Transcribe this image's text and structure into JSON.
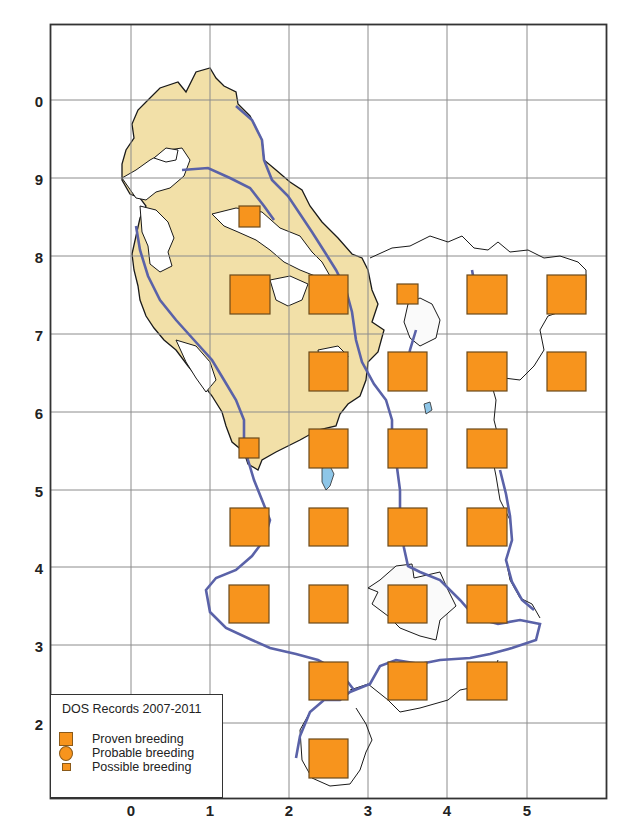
{
  "map": {
    "title": "DOS Records 2007-2011",
    "colors": {
      "record_fill": "#f7941d",
      "record_stroke": "#6b4a1c",
      "land_shading": "#f2e0a8",
      "river": "#5a62a8",
      "water": "#8ec6e8",
      "grid": "#888888",
      "frame": "#333333"
    },
    "x_axis_labels": [
      "0",
      "1",
      "2",
      "3",
      "4",
      "5"
    ],
    "y_axis_labels": [
      "0",
      "9",
      "8",
      "7",
      "6",
      "5",
      "4",
      "3",
      "2"
    ],
    "legend": {
      "title": "DOS Records 2007-2011",
      "items": [
        {
          "label": "Proven breeding",
          "symbol": "large-square"
        },
        {
          "label": "Probable breeding",
          "symbol": "circle"
        },
        {
          "label": "Possible breeding",
          "symbol": "small-square"
        }
      ]
    },
    "records": [
      {
        "grid_x": 1,
        "grid_y": "9",
        "status": "possible"
      },
      {
        "grid_x": 1,
        "grid_y": "8",
        "status": "proven"
      },
      {
        "grid_x": 2,
        "grid_y": "8",
        "status": "proven"
      },
      {
        "grid_x": 3,
        "grid_y": "8",
        "status": "possible"
      },
      {
        "grid_x": 4,
        "grid_y": "8",
        "status": "proven"
      },
      {
        "grid_x": 5,
        "grid_y": "8",
        "status": "proven"
      },
      {
        "grid_x": 2,
        "grid_y": "7",
        "status": "proven"
      },
      {
        "grid_x": 3,
        "grid_y": "7",
        "status": "proven"
      },
      {
        "grid_x": 4,
        "grid_y": "7",
        "status": "proven"
      },
      {
        "grid_x": 5,
        "grid_y": "7",
        "status": "proven"
      },
      {
        "grid_x": 1,
        "grid_y": "6",
        "status": "possible"
      },
      {
        "grid_x": 2,
        "grid_y": "6",
        "status": "proven"
      },
      {
        "grid_x": 3,
        "grid_y": "6",
        "status": "proven"
      },
      {
        "grid_x": 4,
        "grid_y": "6",
        "status": "proven"
      },
      {
        "grid_x": 1,
        "grid_y": "5",
        "status": "proven"
      },
      {
        "grid_x": 2,
        "grid_y": "5",
        "status": "proven"
      },
      {
        "grid_x": 3,
        "grid_y": "5",
        "status": "proven"
      },
      {
        "grid_x": 4,
        "grid_y": "5",
        "status": "proven"
      },
      {
        "grid_x": 1,
        "grid_y": "4",
        "status": "proven"
      },
      {
        "grid_x": 2,
        "grid_y": "4",
        "status": "proven"
      },
      {
        "grid_x": 3,
        "grid_y": "4",
        "status": "proven"
      },
      {
        "grid_x": 4,
        "grid_y": "4",
        "status": "proven"
      },
      {
        "grid_x": 2,
        "grid_y": "3",
        "status": "proven"
      },
      {
        "grid_x": 3,
        "grid_y": "3",
        "status": "proven"
      },
      {
        "grid_x": 4,
        "grid_y": "3",
        "status": "proven"
      },
      {
        "grid_x": 2,
        "grid_y": "2",
        "status": "proven"
      }
    ]
  }
}
